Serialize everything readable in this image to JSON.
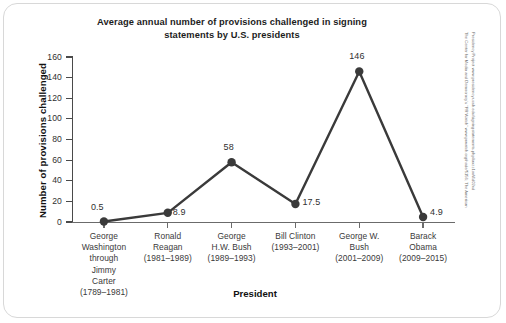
{
  "chart_data": {
    "type": "line",
    "title": "Average annual number of provisions challenged in signing statements by U.S. presidents",
    "title_line1": "Average annual number of provisions challenged in signing",
    "title_line2": "statements by U.S. presidents",
    "xlabel": "President",
    "ylabel": "Number of provisions challenged",
    "ylim": [
      0,
      160
    ],
    "yticks": [
      0,
      20,
      40,
      60,
      80,
      100,
      120,
      140,
      160
    ],
    "ytick_labels": [
      "0",
      "20",
      "40",
      "60",
      "80",
      "100",
      "120",
      "140",
      "160"
    ],
    "grid": false,
    "legend": "none",
    "categories": [
      "George Washington through Jimmy Carter (1789–1981)",
      "Ronald Reagan (1981–1989)",
      "George H.W. Bush (1989–1993)",
      "Bill Clinton (1993–2001)",
      "George W. Bush (2001–2009)",
      "Barack Obama (2009–2015)"
    ],
    "category_lines": [
      [
        "George",
        "Washington",
        "through",
        "Jimmy",
        "Carter",
        "(1789–1981)"
      ],
      [
        "Ronald",
        "Reagan",
        "(1981–1989)"
      ],
      [
        "George",
        "H.W. Bush",
        "(1989–1993)"
      ],
      [
        "Bill Clinton",
        "(1993–2001)"
      ],
      [
        "George W.",
        "Bush",
        "(2001–2009)"
      ],
      [
        "Barack",
        "Obama",
        "(2009–2015)"
      ]
    ],
    "values": [
      0.5,
      8.9,
      58,
      17.5,
      146,
      4.9
    ],
    "value_labels": [
      "0.5",
      "8.9",
      "58",
      "17.5",
      "146",
      "4.9"
    ],
    "series_color": "#3a3a3a",
    "marker": "circle"
  },
  "source": {
    "line1": "The Center for Media and Democracy's \"PR Watch\" www.prwatch.org/node/5156; The American",
    "line2": "Presidency Project www.presidency.ucsb.edu/signingstatements.php#axzz1oxWd02vd"
  }
}
